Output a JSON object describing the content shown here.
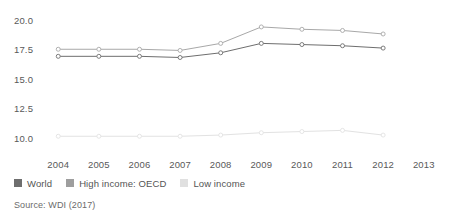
{
  "chart_data": {
    "type": "line",
    "title": "",
    "subtitle": "",
    "xlabel": "",
    "ylabel": "",
    "x": [
      2004,
      2005,
      2006,
      2007,
      2008,
      2009,
      2010,
      2011,
      2012
    ],
    "categories": [
      "2004",
      "2005",
      "2006",
      "2007",
      "2008",
      "2009",
      "2010",
      "2011",
      "2012"
    ],
    "xticks": [
      "2004",
      "2005",
      "2006",
      "2007",
      "2008",
      "2009",
      "2010",
      "2011",
      "2012",
      "2013"
    ],
    "yticks": [
      "10.0",
      "12.5",
      "15.0",
      "17.5",
      "20.0"
    ],
    "ytick_values": [
      10.0,
      12.5,
      15.0,
      17.5,
      20.0
    ],
    "ylim": [
      9.2,
      20.6
    ],
    "xlim": [
      2003.6,
      2013.4
    ],
    "grid": false,
    "legend_position": "below",
    "markers": "open-circle",
    "series": [
      {
        "name": "World",
        "color": "#6e6e6e",
        "values": [
          17.0,
          17.0,
          17.0,
          16.9,
          17.3,
          18.1,
          18.0,
          17.9,
          17.7
        ]
      },
      {
        "name": "High income: OECD",
        "color": "#a8a8a8",
        "values": [
          17.6,
          17.6,
          17.6,
          17.5,
          18.1,
          19.5,
          19.3,
          19.2,
          18.9
        ]
      },
      {
        "name": "Low income",
        "color": "#e2e2e2",
        "values": [
          10.2,
          10.2,
          10.2,
          10.2,
          10.3,
          10.5,
          10.6,
          10.7,
          10.3
        ]
      }
    ]
  },
  "legend": {
    "items": [
      {
        "label": "World",
        "color": "#6e6e6e"
      },
      {
        "label": "High income: OECD",
        "color": "#9e9e9e"
      },
      {
        "label": "Low income",
        "color": "#e0e0e0"
      }
    ]
  },
  "footer": {
    "source": "Source: WDI (2017)"
  }
}
